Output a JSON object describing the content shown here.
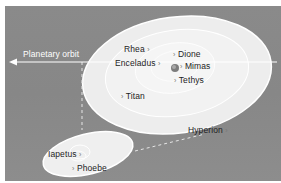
{
  "diagram": {
    "planetary_orbit_label": "Planetary orbit",
    "moons": [
      {
        "name": "Rhea",
        "marker": "›"
      },
      {
        "name": "Dione",
        "marker": "›"
      },
      {
        "name": "Enceladus",
        "marker": "›"
      },
      {
        "name": "Mimas",
        "marker": "›"
      },
      {
        "name": "Tethys",
        "marker": "›"
      },
      {
        "name": "Titan",
        "marker": "›"
      },
      {
        "name": "Hyperion",
        "marker": "›"
      },
      {
        "name": "Iapetus",
        "marker": "›"
      },
      {
        "name": "Phoebe",
        "marker": "›"
      }
    ],
    "colors": {
      "background": "#8a8a8a",
      "orbit_fill": "#efefef",
      "orbit_line": "#ffffff",
      "text": "#1e1e1e"
    }
  }
}
